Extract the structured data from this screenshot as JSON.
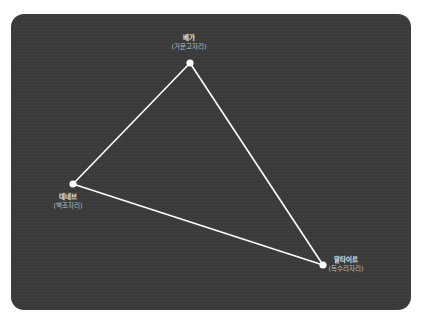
{
  "diagram": {
    "colors": {
      "background": "#3b3b3b",
      "line": "#ffffff",
      "point": "#ffffff",
      "name_text": "#e6e6e6",
      "sub_text": "#bdbdbd"
    },
    "stars": [
      {
        "id": "vega",
        "name": "베가",
        "constellation": "(거문고자리)",
        "x": 190,
        "y": 63
      },
      {
        "id": "deneb",
        "name": "데네브",
        "constellation": "(백조자리)",
        "x": 73,
        "y": 184
      },
      {
        "id": "altair",
        "name": "알타이르",
        "constellation": "(독수리자리)",
        "x": 323,
        "y": 265
      }
    ],
    "edges": [
      [
        "vega",
        "deneb"
      ],
      [
        "deneb",
        "altair"
      ],
      [
        "altair",
        "vega"
      ]
    ]
  }
}
